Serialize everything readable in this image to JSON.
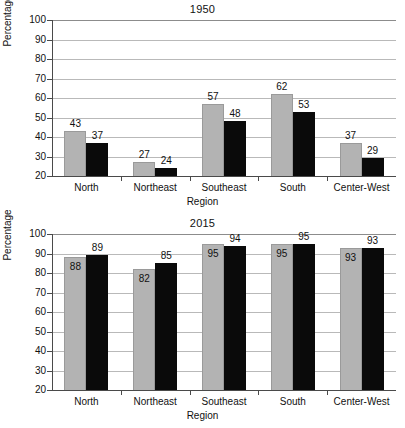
{
  "figure": {
    "y_axis_caption": "Percentage",
    "x_axis_caption": "Region",
    "y_ticks": [
      "100",
      "90",
      "80",
      "70",
      "60",
      "50",
      "40",
      "30",
      "20"
    ],
    "colors": {
      "series_1": "#b3b3b3",
      "series_2": "#0a0a0a",
      "gridline": "#b9b9b9",
      "axis": "#4a4a4a"
    }
  },
  "chart_data": [
    {
      "type": "bar",
      "title": "1950",
      "xlabel": "Region",
      "ylabel": "Percentage",
      "ylim": [
        20,
        100
      ],
      "ytick_step": 10,
      "grid": true,
      "legend": "none",
      "categories": [
        "North",
        "Northeast",
        "Southeast",
        "South",
        "Center-West"
      ],
      "series": [
        {
          "name": "series-1-gray",
          "values": [
            43,
            27,
            57,
            62,
            37
          ]
        },
        {
          "name": "series-2-black",
          "values": [
            37,
            24,
            48,
            53,
            29
          ]
        }
      ]
    },
    {
      "type": "bar",
      "title": "2015",
      "xlabel": "Region",
      "ylabel": "Percentage",
      "ylim": [
        20,
        100
      ],
      "ytick_step": 10,
      "grid": true,
      "legend": "none",
      "categories": [
        "North",
        "Northeast",
        "Southeast",
        "South",
        "Center-West"
      ],
      "series": [
        {
          "name": "series-1-gray",
          "values": [
            88,
            82,
            95,
            95,
            93
          ]
        },
        {
          "name": "series-2-black",
          "values": [
            89,
            85,
            94,
            95,
            93
          ]
        }
      ]
    }
  ]
}
